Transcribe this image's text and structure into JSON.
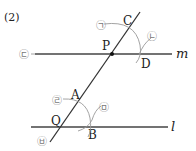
{
  "problem": {
    "number_label": "(2)"
  },
  "lines": {
    "m": {
      "label": "m"
    },
    "l": {
      "label": "l"
    },
    "transversal": {
      "label": ""
    }
  },
  "points": {
    "P": "P",
    "C": "C",
    "D": "D",
    "A": "A",
    "Q": "Q",
    "B": "B"
  },
  "angle_markers": {
    "a": "㉠",
    "b": "㉡",
    "c": "㉢",
    "d": "㉣",
    "e": "㉤",
    "f": "㉥"
  },
  "colors": {
    "line": "#333333",
    "arc": "#999999",
    "marker": "#888888",
    "text": "#222222"
  }
}
